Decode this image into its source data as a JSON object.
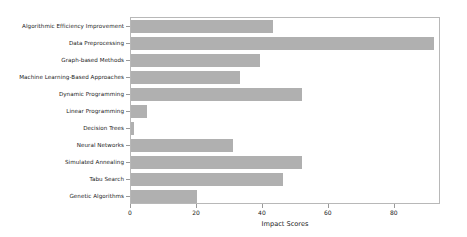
{
  "chart_data": {
    "type": "bar",
    "orientation": "horizontal",
    "title": "",
    "xlabel": "Impact Scores",
    "ylabel": "",
    "xlim": [
      0,
      94
    ],
    "xticks": [
      0,
      20,
      40,
      60,
      80
    ],
    "xtick_labels": [
      "0",
      "20",
      "40",
      "60",
      "80"
    ],
    "grid": false,
    "legend": null,
    "bar_color": "#b0b0b0",
    "axis_color": "#b8b8b8",
    "text_color": "#1a1a1a",
    "categories": [
      "Algorithmic Efficiency Improvement",
      "Data Preprocessing",
      "Graph-based Methods",
      "Machine Learning-Based Approaches",
      "Dynamic Programming",
      "Linear Programming",
      "Decision Trees",
      "Neural Networks",
      "Simulated Annealing",
      "Tabu Search",
      "Genetic Algorithms"
    ],
    "values": [
      43,
      92,
      39,
      33,
      52,
      5,
      1,
      31,
      52,
      46,
      20
    ]
  }
}
